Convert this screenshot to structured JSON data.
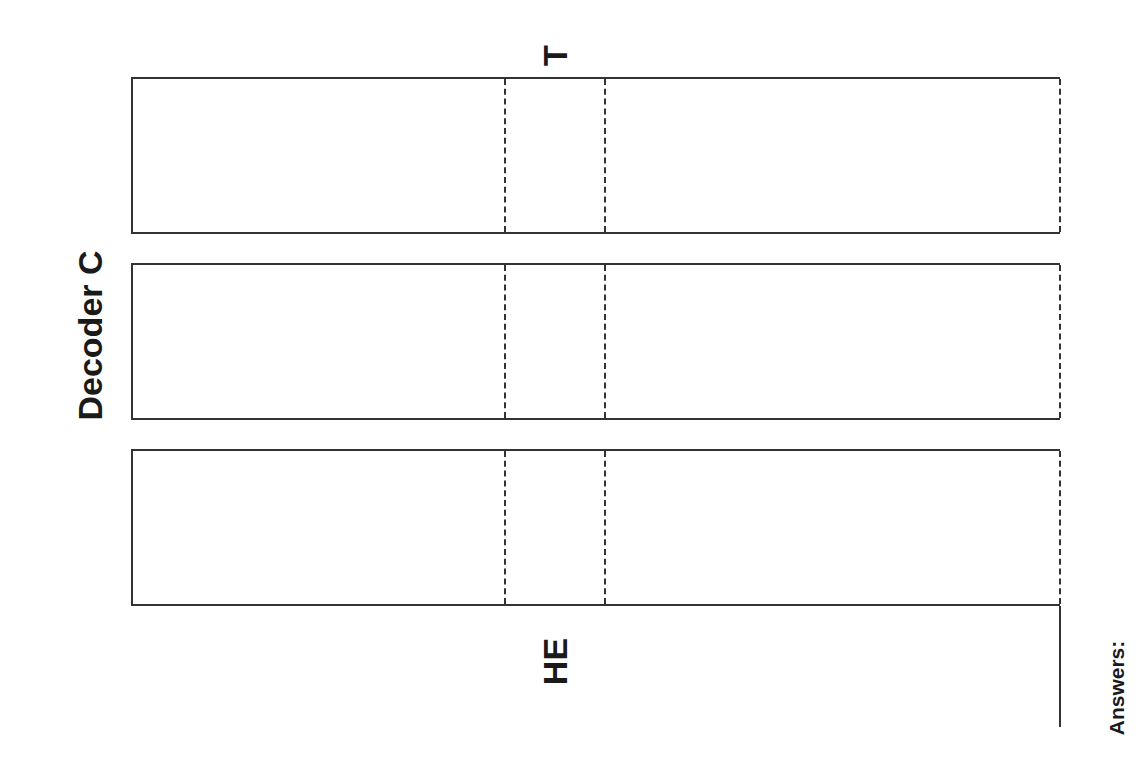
{
  "document": {
    "title": "Decoder C",
    "top_label": "T",
    "bottom_label": "HE",
    "answers_label": "Answers:",
    "strips": [
      {
        "id": 1
      },
      {
        "id": 2
      },
      {
        "id": 3
      }
    ],
    "colors": {
      "line": "#333333",
      "text": "#1a1a1a",
      "background": "#ffffff"
    }
  }
}
